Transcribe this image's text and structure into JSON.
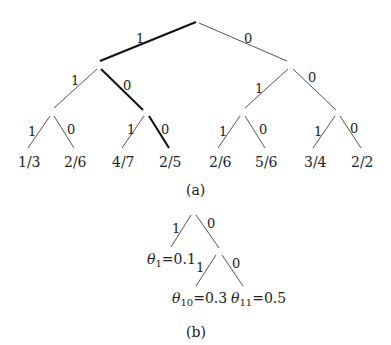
{
  "figure_a": {
    "caption": "(a)",
    "root_edges": [
      {
        "label": "1",
        "bold": true
      },
      {
        "label": "0",
        "bold": false
      }
    ],
    "level2_edges": [
      {
        "label": "1",
        "bold": false
      },
      {
        "label": "0",
        "bold": true
      },
      {
        "label": "1",
        "bold": false
      },
      {
        "label": "0",
        "bold": false
      }
    ],
    "level3_edges": [
      {
        "label": "1",
        "bold": false
      },
      {
        "label": "0",
        "bold": false
      },
      {
        "label": "1",
        "bold": false
      },
      {
        "label": "0",
        "bold": true
      },
      {
        "label": "1",
        "bold": false
      },
      {
        "label": "0",
        "bold": false
      },
      {
        "label": "1",
        "bold": false
      },
      {
        "label": "0",
        "bold": false
      }
    ],
    "leaves": [
      "1/3",
      "2/6",
      "4/7",
      "2/5",
      "2/6",
      "5/6",
      "3/4",
      "2/2"
    ]
  },
  "figure_b": {
    "caption": "(b)",
    "edges": [
      {
        "label": "1"
      },
      {
        "label": "0"
      },
      {
        "label": "1"
      },
      {
        "label": "0"
      }
    ],
    "leaves": [
      {
        "symbol": "θ",
        "subscript": "1",
        "value": "=0.1"
      },
      {
        "symbol": "θ",
        "subscript": "10",
        "value": "=0.3"
      },
      {
        "symbol": "θ",
        "subscript": "11",
        "value": "=0.5"
      }
    ]
  },
  "colors": {
    "line": "#555555",
    "bold_line": "#111111",
    "text": "#222222"
  }
}
